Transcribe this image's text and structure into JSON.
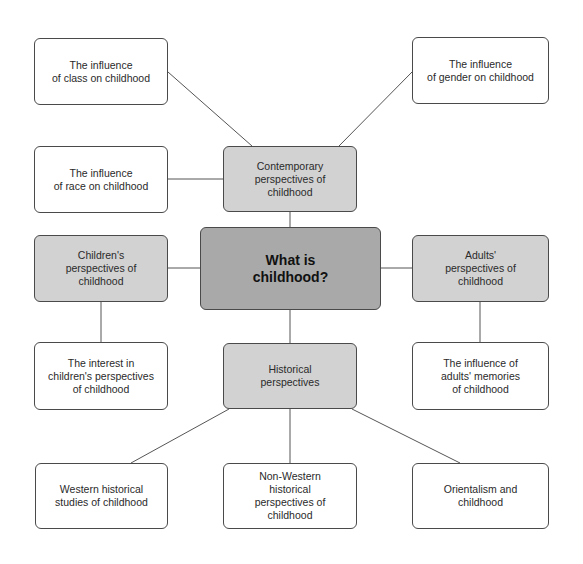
{
  "diagram": {
    "type": "concept-map",
    "colors": {
      "center_fill": "#a9a9a9",
      "mid_fill": "#d2d2d2",
      "leaf_fill": "#ffffff",
      "border": "#4a4a4a",
      "line": "#555555"
    },
    "center": {
      "label": "What is\nchildhood?"
    },
    "branches": {
      "contemporary": {
        "label": "Contemporary\nperspectives of\nchildhood"
      },
      "children": {
        "label": "Children's\nperspectives of\nchildhood"
      },
      "adults": {
        "label": "Adults'\nperspectives of\nchildhood"
      },
      "historical": {
        "label": "Historical\nperspectives"
      }
    },
    "leaves": {
      "class": {
        "label": "The influence\nof class on childhood"
      },
      "gender": {
        "label": "The influence\nof gender on childhood"
      },
      "race": {
        "label": "The influence\nof race on childhood"
      },
      "interest": {
        "label": "The interest in\nchildren's perspectives\nof childhood"
      },
      "memories": {
        "label": "The influence of\nadults' memories\nof childhood"
      },
      "western": {
        "label": "Western historical\nstudies of childhood"
      },
      "non_western": {
        "label": "Non-Western\nhistorical\nperspectives of\nchildhood"
      },
      "orientalism": {
        "label": "Orientalism and\nchildhood"
      }
    },
    "edges": [
      [
        "center",
        "contemporary"
      ],
      [
        "center",
        "children"
      ],
      [
        "center",
        "adults"
      ],
      [
        "center",
        "historical"
      ],
      [
        "contemporary",
        "class"
      ],
      [
        "contemporary",
        "gender"
      ],
      [
        "contemporary",
        "race"
      ],
      [
        "children",
        "interest"
      ],
      [
        "adults",
        "memories"
      ],
      [
        "historical",
        "western"
      ],
      [
        "historical",
        "non_western"
      ],
      [
        "historical",
        "orientalism"
      ]
    ]
  }
}
